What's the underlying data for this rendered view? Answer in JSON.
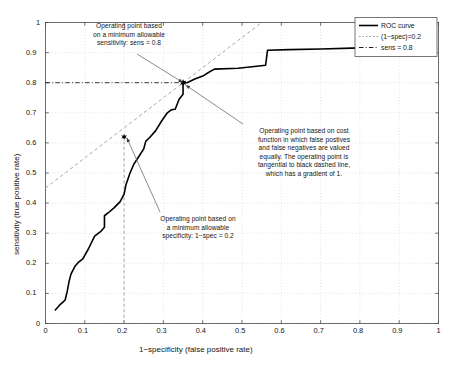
{
  "chart_data": {
    "type": "line",
    "title": "",
    "xlabel": "1−specificity (false positive rate)",
    "ylabel": "sensitivity (true positive rate)",
    "xlim": [
      0,
      1
    ],
    "ylim": [
      0,
      1
    ],
    "grid": true,
    "legend_position": "top-right",
    "xticks": [
      "0",
      "0.1",
      "0.2",
      "0.3",
      "0.4",
      "0.5",
      "0.6",
      "0.7",
      "0.8",
      "0.9",
      "1"
    ],
    "yticks": [
      "0",
      "0.1",
      "0.2",
      "0.3",
      "0.4",
      "0.5",
      "0.6",
      "0.7",
      "0.8",
      "0.9",
      "1"
    ],
    "series": [
      {
        "name": "ROC curve",
        "style": "solid-black",
        "color": "#000000",
        "x": [
          0.025,
          0.035,
          0.045,
          0.05,
          0.055,
          0.06,
          0.065,
          0.075,
          0.085,
          0.095,
          0.11,
          0.125,
          0.14,
          0.15,
          0.15,
          0.16,
          0.175,
          0.19,
          0.2,
          0.205,
          0.215,
          0.225,
          0.24,
          0.25,
          0.255,
          0.265,
          0.28,
          0.295,
          0.31,
          0.32,
          0.33,
          0.34,
          0.35,
          0.35,
          0.36,
          0.38,
          0.4,
          0.42,
          0.43,
          0.49,
          0.52,
          0.56,
          0.565,
          0.62,
          0.7,
          0.78,
          0.86,
          0.93,
          0.985
        ],
        "y": [
          0.045,
          0.06,
          0.072,
          0.078,
          0.105,
          0.14,
          0.165,
          0.19,
          0.205,
          0.215,
          0.25,
          0.29,
          0.305,
          0.32,
          0.358,
          0.368,
          0.385,
          0.405,
          0.43,
          0.462,
          0.5,
          0.53,
          0.56,
          0.58,
          0.605,
          0.618,
          0.64,
          0.672,
          0.7,
          0.71,
          0.712,
          0.745,
          0.762,
          0.8,
          0.8,
          0.812,
          0.822,
          0.838,
          0.845,
          0.848,
          0.852,
          0.858,
          0.908,
          0.91,
          0.912,
          0.915,
          0.918,
          0.922,
          0.925
        ]
      },
      {
        "name": "(1−spec)=0.2",
        "style": "dotted-gray-vertical",
        "color": "#8c8c8c",
        "description": "vertical dotted line at x = 0.2 from y=0 to the operating point"
      },
      {
        "name": "sens = 0.8",
        "style": "dashdot-black-horizontal",
        "color": "#1a1a1a",
        "description": "horizontal dash-dot line at y = 0.8 from x=0 to the operating point"
      },
      {
        "name": "tangent line",
        "style": "dashed-gray-diagonal",
        "color": "#9a9a9a",
        "gradient": 1,
        "intercept": 0.45,
        "x": [
          0.0,
          0.55
        ],
        "y": [
          0.45,
          1.0
        ]
      }
    ],
    "operating_points": [
      {
        "name": "min-specificity-point",
        "x": 0.2,
        "y": 0.62,
        "marker": "star"
      },
      {
        "name": "min-sensitivity-point",
        "x": 0.35,
        "y": 0.8,
        "marker": "star"
      },
      {
        "name": "cost-function-point",
        "x": 0.35,
        "y": 0.8,
        "marker": "star"
      }
    ]
  },
  "legend": {
    "items": [
      {
        "label": "ROC curve",
        "style": "solid"
      },
      {
        "label": "(1−spec)=0.2",
        "style": "dotted"
      },
      {
        "label": "sens = 0.8",
        "style": "dashdot"
      }
    ]
  },
  "annotations": {
    "sensitivity": "Operating point based\non a minimum allowable\nsensitivity: sens = 0.8",
    "cost": "Operating point based on cost\nfunction in which false postives\nand false negatives are valued\nequally. The operating point is\ntangential to black dashed line,\nwhich has a gradient of 1.",
    "specificity": "Operating point based on\na minimum allowable\nspecificity: 1−spec = 0.2"
  },
  "axes": {
    "x_title": "1−specificity (false positive rate)",
    "y_title": "sensitivity (true positive rate)"
  }
}
